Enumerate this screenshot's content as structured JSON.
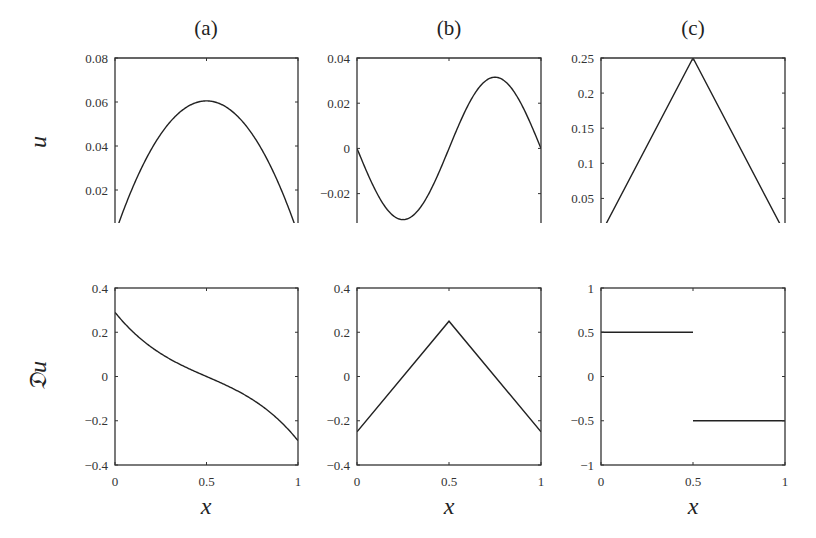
{
  "figure": {
    "panel_titles": [
      "(a)",
      "(b)",
      "(c)"
    ],
    "row_labels": [
      "u",
      "𝔇u"
    ],
    "xlabel": "x"
  },
  "chart_data": [
    {
      "id": "a-top",
      "type": "line",
      "title": "(a)",
      "xlabel": "",
      "ylabel": "u",
      "xlim": [
        0,
        1
      ],
      "ylim": [
        0.005,
        0.08
      ],
      "yticks": [
        0.02,
        0.04,
        0.06,
        0.08
      ],
      "ytick_labels": [
        "0.02",
        "0.04",
        "0.06",
        "0.08"
      ],
      "xticks": [
        0,
        0.5,
        1
      ],
      "xtick_labels": [],
      "grid": false,
      "series": [
        {
          "name": "u",
          "kind": "parabola",
          "x": [
            0,
            0.1,
            0.2,
            0.3,
            0.4,
            0.5,
            0.6,
            0.7,
            0.8,
            0.9,
            1
          ],
          "values": [
            0.0,
            0.023,
            0.04,
            0.051,
            0.058,
            0.0605,
            0.058,
            0.051,
            0.04,
            0.023,
            0.0
          ]
        }
      ]
    },
    {
      "id": "b-top",
      "type": "line",
      "title": "(b)",
      "xlabel": "",
      "ylabel": "",
      "xlim": [
        0,
        1
      ],
      "ylim": [
        -0.033,
        0.04
      ],
      "yticks": [
        -0.02,
        0,
        0.02,
        0.04
      ],
      "ytick_labels": [
        "−0.02",
        "0",
        "0.02",
        "0.04"
      ],
      "xticks": [
        0,
        0.5,
        1
      ],
      "xtick_labels": [],
      "grid": false,
      "series": [
        {
          "name": "u",
          "kind": "antisymmetric",
          "x": [
            0,
            0.1,
            0.2,
            0.25,
            0.3,
            0.4,
            0.5,
            0.6,
            0.7,
            0.75,
            0.8,
            0.9,
            1
          ],
          "values": [
            0,
            -0.02,
            -0.03,
            -0.0315,
            -0.03,
            -0.02,
            0,
            0.02,
            0.03,
            0.0315,
            0.03,
            0.02,
            0
          ]
        }
      ]
    },
    {
      "id": "c-top",
      "type": "line",
      "title": "(c)",
      "xlabel": "",
      "ylabel": "",
      "xlim": [
        0,
        1
      ],
      "ylim": [
        0.015,
        0.25
      ],
      "yticks": [
        0.05,
        0.1,
        0.15,
        0.2,
        0.25
      ],
      "ytick_labels": [
        "0.05",
        "0.1",
        "0.15",
        "0.2",
        "0.25"
      ],
      "xticks": [
        0,
        0.5,
        1
      ],
      "xtick_labels": [],
      "grid": false,
      "series": [
        {
          "name": "u",
          "kind": "polyline",
          "x": [
            0,
            0.5,
            1
          ],
          "values": [
            0,
            0.25,
            0
          ]
        }
      ]
    },
    {
      "id": "a-bottom",
      "type": "line",
      "title": "",
      "xlabel": "x",
      "ylabel": "𝔇u",
      "xlim": [
        0,
        1
      ],
      "ylim": [
        -0.4,
        0.4
      ],
      "yticks": [
        -0.4,
        -0.2,
        0,
        0.2,
        0.4
      ],
      "ytick_labels": [
        "−0.4",
        "−0.2",
        "0",
        "0.2",
        "0.4"
      ],
      "xticks": [
        0,
        0.5,
        1
      ],
      "xtick_labels": [
        "0",
        "0.5",
        "1"
      ],
      "grid": false,
      "series": [
        {
          "name": "Du",
          "kind": "smooth",
          "x": [
            0,
            0.1,
            0.2,
            0.3,
            0.4,
            0.5,
            0.6,
            0.7,
            0.8,
            0.9,
            1
          ],
          "values": [
            0.29,
            0.21,
            0.14,
            0.09,
            0.045,
            0,
            -0.045,
            -0.09,
            -0.14,
            -0.21,
            -0.29
          ]
        }
      ]
    },
    {
      "id": "b-bottom",
      "type": "line",
      "title": "",
      "xlabel": "x",
      "ylabel": "",
      "xlim": [
        0,
        1
      ],
      "ylim": [
        -0.4,
        0.4
      ],
      "yticks": [
        -0.4,
        -0.2,
        0,
        0.2,
        0.4
      ],
      "ytick_labels": [
        "−0.4",
        "−0.2",
        "0",
        "0.2",
        "0.4"
      ],
      "xticks": [
        0,
        0.5,
        1
      ],
      "xtick_labels": [
        "0",
        "0.5",
        "1"
      ],
      "grid": false,
      "series": [
        {
          "name": "Du",
          "kind": "polyline",
          "x": [
            0,
            0.5,
            1
          ],
          "values": [
            -0.25,
            0.25,
            -0.25
          ]
        }
      ]
    },
    {
      "id": "c-bottom",
      "type": "line",
      "title": "",
      "xlabel": "x",
      "ylabel": "",
      "xlim": [
        0,
        1
      ],
      "ylim": [
        -1,
        1
      ],
      "yticks": [
        -1,
        -0.5,
        0,
        0.5,
        1
      ],
      "ytick_labels": [
        "−1",
        "−0.5",
        "0",
        "0.5",
        "1"
      ],
      "xticks": [
        0,
        0.5,
        1
      ],
      "xtick_labels": [
        "0",
        "0.5",
        "1"
      ],
      "grid": false,
      "series": [
        {
          "name": "Du",
          "kind": "step",
          "segments": [
            {
              "x": [
                0,
                0.5
              ],
              "values": [
                0.5,
                0.5
              ]
            },
            {
              "x": [
                0.5,
                1
              ],
              "values": [
                -0.5,
                -0.5
              ]
            }
          ]
        }
      ]
    }
  ]
}
